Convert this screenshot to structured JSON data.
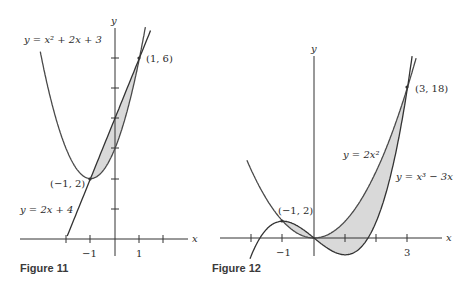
{
  "figures": [
    {
      "caption": "Figure 11",
      "axis_labels": {
        "x": "x",
        "y": "y"
      },
      "x_tick_labels": [
        "−1",
        "1"
      ],
      "curves": [
        {
          "label": "y = x² + 2x + 3",
          "equation": "x^2+2x+3"
        },
        {
          "label": "y = 2x + 4",
          "equation": "2x+4"
        }
      ],
      "points": [
        {
          "label": "(1, 6)",
          "x": 1,
          "y": 6
        },
        {
          "label": "(−1, 2)",
          "x": -1,
          "y": 2
        }
      ],
      "shaded_region": "between y = 2x + 4 and y = x² + 2x + 3 on [−1, 1]"
    },
    {
      "caption": "Figure 12",
      "axis_labels": {
        "x": "x",
        "y": "y"
      },
      "x_tick_labels": [
        "−1",
        "3"
      ],
      "curves": [
        {
          "label": "y = 2x²",
          "equation": "2x^2"
        },
        {
          "label": "y = x³ − 3x",
          "equation": "x^3-3x"
        }
      ],
      "points": [
        {
          "label": "(3, 18)",
          "x": 3,
          "y": 18
        },
        {
          "label": "(−1, 2)",
          "x": -1,
          "y": 2
        }
      ],
      "shaded_region": "between y = 2x² and y = x³ − 3x on [−1, 3]"
    }
  ],
  "colors": {
    "curve": "#4a4a4a",
    "shade": "#d9d9d9",
    "axis": "#333333"
  }
}
